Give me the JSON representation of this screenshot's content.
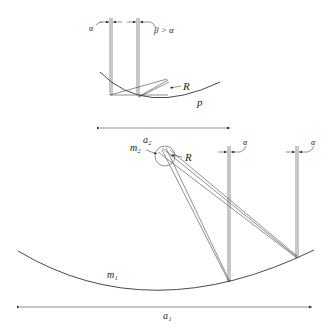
{
  "diagram": {
    "top": {
      "labels": {
        "alpha": "α",
        "beta_gt_alpha": "β > α",
        "R": "R",
        "p": "p",
        "a2": "a₂"
      }
    },
    "bottom": {
      "labels": {
        "m2": "m₂",
        "R": "R",
        "alpha_1": "α",
        "alpha_2": "α",
        "m1": "m₁",
        "a1": "a₁"
      }
    },
    "colors": {
      "line": "#333333",
      "background": "#ffffff"
    }
  }
}
